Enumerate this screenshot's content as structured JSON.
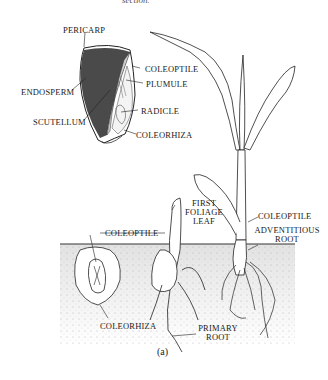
{
  "figure": {
    "top_caption_fragment": "section.",
    "caption": "(a)",
    "seed_section_labels": {
      "pericarp": "PERICARP",
      "endosperm": "ENDOSPERM",
      "scutellum": "SCUTELLUM",
      "coleoptile": "COLEOPTILE",
      "plumule": "PLUMULE",
      "radicle": "RADICLE",
      "coleorhiza": "COLEORHIZA"
    },
    "seedling_labels": {
      "coleoptile_left": "COLEOPTILE",
      "coleorhiza_bottom": "COLEORHIZA",
      "first_foliage_leaf_1": "FIRST",
      "first_foliage_leaf_2": "FOLIAGE",
      "first_foliage_leaf_3": "LEAF",
      "coleoptile_right": "COLEOPTILE",
      "adventitious_root_1": "ADVENTITIOUS",
      "adventitious_root_2": "ROOT",
      "primary_root_1": "PRIMARY",
      "primary_root_2": "ROOT"
    },
    "colors": {
      "ink": "#1a1a1a",
      "endosperm": "#4a4a4a",
      "soil": "#ececec",
      "scutellum": "#cfcfcf"
    }
  }
}
